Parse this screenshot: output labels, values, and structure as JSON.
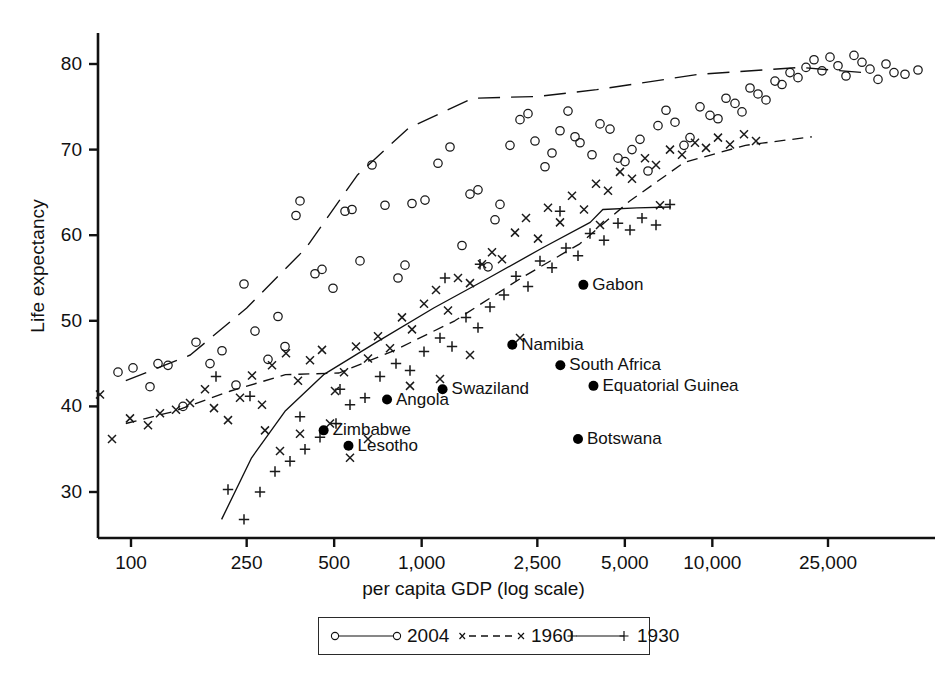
{
  "chart_data": {
    "type": "scatter",
    "title": "",
    "xlabel": "per capita GDP (log scale)",
    "ylabel": "Life expectancy",
    "xscale": "log",
    "xlim": [
      90,
      40000
    ],
    "ylim": [
      26,
      84
    ],
    "xticks": [
      100,
      250,
      500,
      1000,
      2500,
      5000,
      10000,
      25000
    ],
    "xtick_labels": [
      "100",
      "250",
      "500",
      "1,000",
      "2,500",
      "5,000",
      "10,000",
      "25,000"
    ],
    "yticks": [
      30,
      40,
      50,
      60,
      70,
      80
    ],
    "ytick_labels": [
      "30",
      "40",
      "50",
      "60",
      "70",
      "80"
    ],
    "grid": false,
    "legend_position": "below-axis-centered",
    "legend": [
      {
        "name": "2004",
        "marker": "open-circle",
        "line": "long-dash"
      },
      {
        "name": "1960",
        "marker": "x",
        "line": "dashed"
      },
      {
        "name": "1930",
        "marker": "plus",
        "line": "solid"
      }
    ],
    "series": [
      {
        "name": "2004",
        "marker": "open-circle",
        "points": [
          [
            95,
            43.6
          ],
          [
            118,
            44.0
          ],
          [
            133,
            44.5
          ],
          [
            158,
            45.0
          ],
          [
            168,
            44.8
          ],
          [
            150,
            42.3
          ],
          [
            183,
            40.0
          ],
          [
            196,
            47.5
          ],
          [
            210,
            45.0
          ],
          [
            222,
            46.5
          ],
          [
            236,
            42.5
          ],
          [
            244,
            54.3
          ],
          [
            255,
            48.8
          ],
          [
            268,
            45.5
          ],
          [
            278,
            50.5
          ],
          [
            285,
            47.0
          ],
          [
            296,
            62.3
          ],
          [
            300,
            64.0
          ],
          [
            315,
            55.5
          ],
          [
            322,
            56.0
          ],
          [
            333,
            53.8
          ],
          [
            345,
            62.8
          ],
          [
            352,
            63.0
          ],
          [
            360,
            57.0
          ],
          [
            372,
            68.2
          ],
          [
            385,
            63.5
          ],
          [
            398,
            55.0
          ],
          [
            405,
            56.5
          ],
          [
            412,
            63.7
          ],
          [
            425,
            64.1
          ],
          [
            438,
            68.4
          ],
          [
            450,
            70.3
          ],
          [
            462,
            58.8
          ],
          [
            470,
            64.8
          ],
          [
            478,
            65.3
          ],
          [
            488,
            56.3
          ],
          [
            495,
            61.8
          ],
          [
            500,
            63.6
          ],
          [
            510,
            70.5
          ],
          [
            520,
            73.5
          ],
          [
            528,
            74.2
          ],
          [
            535,
            71.0
          ],
          [
            545,
            68.0
          ],
          [
            552,
            69.6
          ],
          [
            560,
            72.2
          ],
          [
            568,
            74.5
          ],
          [
            575,
            71.5
          ],
          [
            580,
            70.8
          ],
          [
            592,
            69.4
          ],
          [
            600,
            73.0
          ],
          [
            610,
            72.4
          ],
          [
            618,
            69.0
          ],
          [
            625,
            68.6
          ],
          [
            632,
            70.0
          ],
          [
            640,
            71.2
          ],
          [
            648,
            67.5
          ],
          [
            658,
            72.8
          ],
          [
            666,
            74.6
          ],
          [
            675,
            73.2
          ],
          [
            684,
            70.5
          ],
          [
            690,
            71.4
          ],
          [
            700,
            75.0
          ],
          [
            710,
            74.0
          ],
          [
            718,
            73.6
          ],
          [
            726,
            76.0
          ],
          [
            735,
            75.4
          ],
          [
            742,
            74.4
          ],
          [
            750,
            77.2
          ],
          [
            758,
            76.5
          ],
          [
            766,
            75.8
          ],
          [
            775,
            78.0
          ],
          [
            782,
            77.6
          ],
          [
            790,
            79.0
          ],
          [
            798,
            78.4
          ],
          [
            806,
            79.6
          ],
          [
            814,
            80.5
          ],
          [
            822,
            79.2
          ],
          [
            830,
            80.8
          ],
          [
            838,
            79.8
          ],
          [
            846,
            78.6
          ],
          [
            854,
            81.0
          ],
          [
            862,
            80.2
          ],
          [
            870,
            79.4
          ],
          [
            878,
            78.2
          ],
          [
            886,
            80.0
          ],
          [
            894,
            79.0
          ],
          [
            905,
            78.8
          ],
          [
            918,
            79.3
          ]
        ]
      },
      {
        "name": "1960",
        "marker": "x",
        "points": [
          [
            100,
            41.4
          ],
          [
            112,
            36.2
          ],
          [
            130,
            38.6
          ],
          [
            148,
            37.8
          ],
          [
            160,
            39.2
          ],
          [
            176,
            39.6
          ],
          [
            190,
            40.4
          ],
          [
            205,
            42.0
          ],
          [
            214,
            39.8
          ],
          [
            228,
            38.4
          ],
          [
            240,
            41.0
          ],
          [
            252,
            43.6
          ],
          [
            262,
            40.2
          ],
          [
            272,
            44.8
          ],
          [
            286,
            46.2
          ],
          [
            298,
            43.0
          ],
          [
            310,
            45.4
          ],
          [
            322,
            46.6
          ],
          [
            335,
            41.8
          ],
          [
            344,
            44.0
          ],
          [
            356,
            47.0
          ],
          [
            368,
            45.6
          ],
          [
            378,
            48.2
          ],
          [
            390,
            46.8
          ],
          [
            402,
            50.4
          ],
          [
            412,
            49.0
          ],
          [
            424,
            52.0
          ],
          [
            436,
            53.6
          ],
          [
            448,
            51.2
          ],
          [
            458,
            55.0
          ],
          [
            470,
            54.4
          ],
          [
            482,
            56.6
          ],
          [
            492,
            58.0
          ],
          [
            502,
            57.2
          ],
          [
            515,
            60.3
          ],
          [
            526,
            62.0
          ],
          [
            538,
            59.6
          ],
          [
            548,
            63.2
          ],
          [
            560,
            61.5
          ],
          [
            572,
            64.6
          ],
          [
            584,
            63.0
          ],
          [
            596,
            66.0
          ],
          [
            608,
            65.2
          ],
          [
            620,
            67.4
          ],
          [
            632,
            66.6
          ],
          [
            645,
            69.0
          ],
          [
            656,
            68.2
          ],
          [
            670,
            70.0
          ],
          [
            682,
            69.4
          ],
          [
            695,
            70.8
          ],
          [
            706,
            70.2
          ],
          [
            718,
            71.4
          ],
          [
            730,
            70.6
          ],
          [
            744,
            71.8
          ],
          [
            756,
            71.0
          ],
          [
            350,
            34.0
          ],
          [
            368,
            36.2
          ],
          [
            330,
            38.0
          ],
          [
            300,
            36.8
          ],
          [
            280,
            34.8
          ],
          [
            265,
            37.2
          ],
          [
            600,
            61.2
          ],
          [
            660,
            63.5
          ],
          [
            520,
            48.0
          ],
          [
            470,
            46.0
          ],
          [
            440,
            43.2
          ],
          [
            410,
            42.4
          ]
        ]
      },
      {
        "name": "1930",
        "marker": "plus",
        "points": [
          [
            228,
            30.3
          ],
          [
            244,
            26.8
          ],
          [
            260,
            30.0
          ],
          [
            275,
            32.4
          ],
          [
            290,
            33.6
          ],
          [
            305,
            35.0
          ],
          [
            320,
            36.4
          ],
          [
            336,
            38.0
          ],
          [
            350,
            40.2
          ],
          [
            365,
            41.0
          ],
          [
            380,
            43.5
          ],
          [
            396,
            45.0
          ],
          [
            410,
            44.2
          ],
          [
            424,
            46.4
          ],
          [
            440,
            48.0
          ],
          [
            452,
            47.0
          ],
          [
            466,
            50.4
          ],
          [
            478,
            49.2
          ],
          [
            490,
            51.6
          ],
          [
            504,
            53.0
          ],
          [
            516,
            55.2
          ],
          [
            528,
            54.0
          ],
          [
            540,
            57.0
          ],
          [
            552,
            56.2
          ],
          [
            566,
            58.5
          ],
          [
            578,
            57.6
          ],
          [
            590,
            60.2
          ],
          [
            604,
            59.4
          ],
          [
            618,
            61.4
          ],
          [
            630,
            60.6
          ],
          [
            642,
            62.0
          ],
          [
            656,
            61.2
          ],
          [
            670,
            63.6
          ],
          [
            300,
            38.8
          ],
          [
            250,
            41.2
          ],
          [
            340,
            42.0
          ],
          [
            216,
            43.5
          ],
          [
            445,
            55.0
          ],
          [
            480,
            56.6
          ],
          [
            560,
            62.8
          ]
        ]
      }
    ],
    "trend_lines": [
      {
        "name": "2004",
        "style": "long-dash",
        "points": [
          [
            96,
            43.0
          ],
          [
            160,
            46.0
          ],
          [
            250,
            51.5
          ],
          [
            400,
            58.5
          ],
          [
            600,
            67.0
          ],
          [
            900,
            72.5
          ],
          [
            1500,
            76.0
          ],
          [
            2500,
            76.2
          ],
          [
            4000,
            77.0
          ],
          [
            9000,
            78.8
          ],
          [
            20000,
            79.6
          ],
          [
            33000,
            79.0
          ]
        ]
      },
      {
        "name": "1960",
        "style": "dashed",
        "points": [
          [
            96,
            38.0
          ],
          [
            140,
            39.4
          ],
          [
            220,
            41.8
          ],
          [
            340,
            43.7
          ],
          [
            520,
            43.9
          ],
          [
            800,
            46.5
          ],
          [
            1300,
            50.0
          ],
          [
            2200,
            55.0
          ],
          [
            3500,
            59.0
          ],
          [
            5200,
            64.0
          ],
          [
            8000,
            68.5
          ],
          [
            13000,
            70.5
          ],
          [
            22000,
            71.5
          ]
        ]
      },
      {
        "name": "1930",
        "style": "solid",
        "points": [
          [
            205,
            26.8
          ],
          [
            260,
            34.0
          ],
          [
            340,
            39.5
          ],
          [
            460,
            43.7
          ],
          [
            700,
            47.5
          ],
          [
            1100,
            51.5
          ],
          [
            1700,
            55.0
          ],
          [
            2600,
            58.5
          ],
          [
            3800,
            61.5
          ],
          [
            4200,
            63.0
          ],
          [
            5500,
            63.2
          ],
          [
            7200,
            63.3
          ]
        ]
      }
    ],
    "highlighted_points": [
      {
        "label": "Gabon",
        "gdp": 3600,
        "life": 54.2,
        "label_side": "right"
      },
      {
        "label": "Namibia",
        "gdp": 2050,
        "life": 47.2,
        "label_side": "right"
      },
      {
        "label": "South Africa",
        "gdp": 3000,
        "life": 44.8,
        "label_side": "right"
      },
      {
        "label": "Equatorial Guinea",
        "gdp": 3900,
        "life": 42.4,
        "label_side": "right"
      },
      {
        "label": "Swaziland",
        "gdp": 1180,
        "life": 42.0,
        "label_side": "right"
      },
      {
        "label": "Angola",
        "gdp": 760,
        "life": 40.8,
        "label_side": "right"
      },
      {
        "label": "Zimbabwe",
        "gdp": 460,
        "life": 37.2,
        "label_side": "right"
      },
      {
        "label": "Lesotho",
        "gdp": 560,
        "life": 35.4,
        "label_side": "right"
      },
      {
        "label": "Botswana",
        "gdp": 3450,
        "life": 36.2,
        "label_side": "right"
      }
    ],
    "colors": {
      "axis": "#111111",
      "marker": "#1a1a1a",
      "highlight": "#000000",
      "background": "#ffffff"
    }
  }
}
